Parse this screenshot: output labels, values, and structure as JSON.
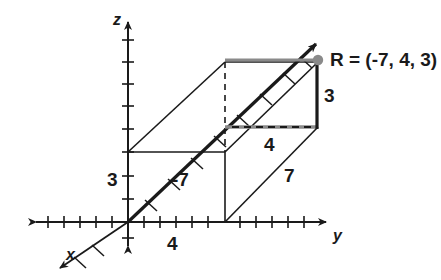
{
  "figure": {
    "type": "geometry-diagram",
    "colors": {
      "stroke": "#1a1a1a",
      "highlight": "#808080",
      "point": "#808080",
      "background": "#ffffff"
    },
    "axes": [
      {
        "name": "x",
        "label": "x",
        "direction": "diagonal-down-left",
        "arrowheads": "both"
      },
      {
        "name": "y",
        "label": "y",
        "direction": "horizontal-right",
        "arrowheads": "both"
      },
      {
        "name": "z",
        "label": "z",
        "direction": "vertical-up",
        "arrowheads": "both"
      }
    ],
    "point": {
      "name": "R",
      "label": "R = (-7, 4, 3)",
      "label_name": "R",
      "label_equals": "=",
      "label_coords": "(-7, 4, 3)",
      "x": -7,
      "y": 4,
      "z": 3
    },
    "measurements": [
      {
        "id": "z-height-axis",
        "value": "3",
        "axis": "z",
        "description": "height marked along z axis"
      },
      {
        "id": "y-base",
        "value": "4",
        "axis": "y",
        "description": "distance along y axis at base"
      },
      {
        "id": "x-depth",
        "value": "-7",
        "axis": "x",
        "description": "depth along x axis, negative"
      },
      {
        "id": "y-top",
        "value": "4",
        "axis": "y",
        "description": "edge of top face along y"
      },
      {
        "id": "x-diagonal",
        "value": "7",
        "axis": "x",
        "description": "slanted edge length"
      },
      {
        "id": "z-height-point",
        "value": "3",
        "axis": "z",
        "description": "vertical drop from point R"
      }
    ],
    "ticks": {
      "y_axis_count": 12,
      "z_axis_count": 9,
      "x_axis_count": 10,
      "spacing_px": 16
    }
  }
}
